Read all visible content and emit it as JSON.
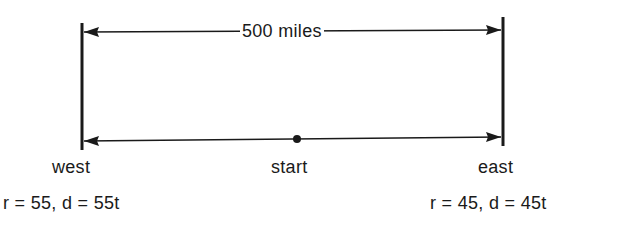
{
  "diagram": {
    "distance_label": "500 miles",
    "start_label": "start",
    "west": {
      "label": "west",
      "equation": "r = 55, d = 55t"
    },
    "east": {
      "label": "east",
      "equation": "r = 45, d = 45t"
    },
    "colors": {
      "line": "#1a1a1a",
      "background": "#ffffff"
    }
  }
}
